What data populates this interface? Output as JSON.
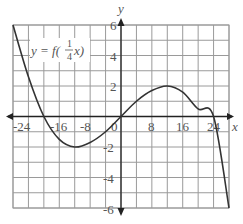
{
  "chart_data": {
    "type": "line",
    "title": "",
    "annotation": "y = f(1/4 x)",
    "annotation_parts": {
      "lhs": "y = f(",
      "num": "1",
      "den": "4",
      "rhs": "x)"
    },
    "xlabel": "x",
    "ylabel": "y",
    "xlim": [
      -28,
      28
    ],
    "ylim": [
      -6,
      6
    ],
    "x_grid_step": 4,
    "y_grid_step": 1,
    "grid": true,
    "x_tick_labels": [
      "-24",
      "-16",
      "-8",
      "0",
      "8",
      "16",
      "24"
    ],
    "x_tick_values": [
      -24,
      -16,
      -8,
      0,
      8,
      16,
      24
    ],
    "y_tick_labels": [
      "6",
      "4",
      "2",
      "-2",
      "-4",
      "-6"
    ],
    "y_tick_values": [
      6,
      4,
      2,
      -2,
      -4,
      -6
    ],
    "series": [
      {
        "name": "y = f(1/4 x)",
        "x": [
          -28,
          -24,
          -20,
          -16,
          -12,
          -8,
          -4,
          0,
          4,
          8,
          12,
          16,
          20,
          24,
          28
        ],
        "y": [
          6,
          2.6,
          0,
          -1.5,
          -2,
          -1.7,
          -1,
          0,
          1,
          1.7,
          2,
          1.6,
          0.5,
          0,
          -6
        ]
      }
    ],
    "key_points": {
      "roots": [
        -20,
        0,
        24
      ],
      "local_min": [
        -12,
        -2
      ],
      "local_max": [
        12,
        2
      ],
      "start": [
        -28,
        6
      ],
      "end": [
        28,
        -6
      ]
    }
  },
  "labels": {
    "x_axis": "x",
    "y_axis": "y",
    "origin": "0",
    "x_ticks": [
      "-24",
      "-16",
      "-8",
      "8",
      "16",
      "24"
    ],
    "y_ticks": [
      "6",
      "4",
      "2",
      "-2",
      "-4",
      "-6"
    ]
  }
}
